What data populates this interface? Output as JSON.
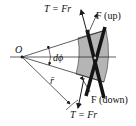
{
  "diagram": {
    "origin_label": "O",
    "angle_label": "dϕ",
    "radius_label": "r̄",
    "torque_top_label": "T = Fr",
    "torque_bottom_label": "T = Fr",
    "force_up_label": "F (up)",
    "force_down_label": "F (down)",
    "colors": {
      "stroke": "#1a1a1a",
      "sector_fill": "#b5b5b5",
      "bar": "#141414",
      "background": "#ffffff"
    }
  }
}
